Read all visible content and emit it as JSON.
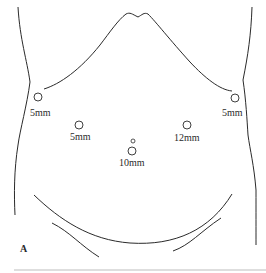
{
  "figure": {
    "panel_label": "A",
    "ports": [
      {
        "label": "5mm",
        "position": "left flank"
      },
      {
        "label": "5mm",
        "position": "right flank"
      },
      {
        "label": "5mm",
        "position": "left mid-abdomen"
      },
      {
        "label": "12mm",
        "position": "right mid-abdomen"
      },
      {
        "label": "10mm",
        "position": "umbilical"
      }
    ],
    "line_color": "#2a2a2a",
    "rule_color": "#bdbdbd"
  }
}
